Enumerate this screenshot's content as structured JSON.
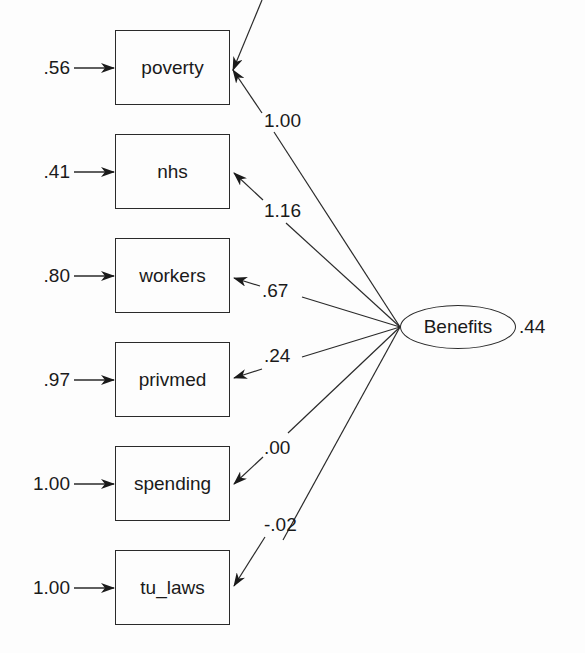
{
  "diagram": {
    "type": "sem-measurement-model",
    "latent": {
      "name": "Benefits",
      "variance": ".44"
    },
    "indicators": [
      {
        "name": "poverty",
        "error": ".56",
        "loading": "1.00"
      },
      {
        "name": "nhs",
        "error": ".41",
        "loading": "1.16"
      },
      {
        "name": "workers",
        "error": ".80",
        "loading": ".67"
      },
      {
        "name": "privmed",
        "error": ".97",
        "loading": ".24"
      },
      {
        "name": "spending",
        "error": "1.00",
        "loading": ".00"
      },
      {
        "name": "tu_laws",
        "error": "1.00",
        "loading": "-.02"
      }
    ],
    "colors": {
      "line": "#2a2a2a",
      "background": "#fdfdfd"
    }
  }
}
